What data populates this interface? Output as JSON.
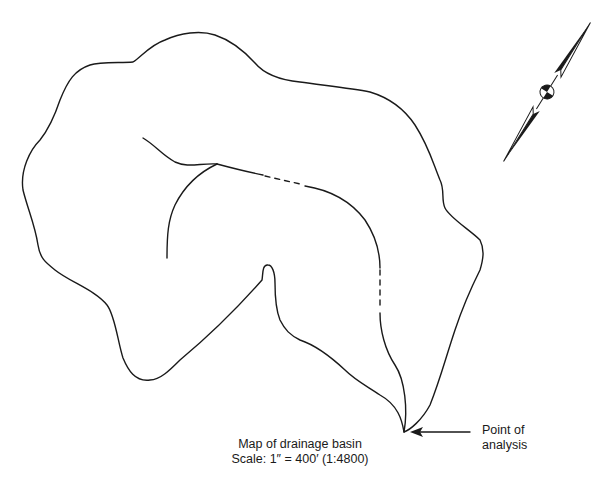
{
  "map": {
    "title": "Map of drainage basin",
    "scale": "Scale: 1″ = 400′ (1:4800)",
    "annotation": {
      "label_line1": "Point of",
      "label_line2": "analysis",
      "arrow": "left-arrow"
    },
    "north_arrow": {
      "icon": "north-arrow-icon",
      "orientation_deg": 32
    },
    "features": {
      "basin_boundary": "solid outline",
      "main_channel": "solid with dashed segments",
      "tributary": "solid"
    },
    "colors": {
      "ink": "#1a1a1a",
      "background": "#ffffff"
    }
  }
}
